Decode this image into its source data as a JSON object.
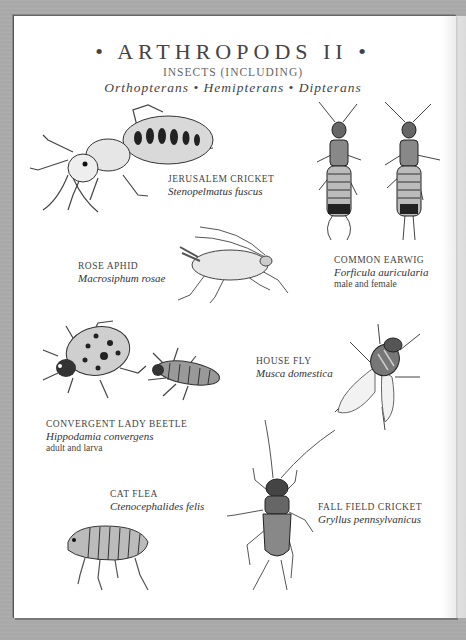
{
  "plate": {
    "title": "• ARTHROPODS II •",
    "subtitle": "INSECTS (INCLUDING)",
    "orders": "Orthopterans • Hemipterans • Dipterans",
    "colors": {
      "background": "#a9a9a9",
      "paper": "#ffffff",
      "ink": "#333333"
    }
  },
  "specimens": [
    {
      "common": "JERUSALEM CRICKET",
      "scientific": "Stenopelmatus fuscus",
      "note": ""
    },
    {
      "common": "COMMON EARWIG",
      "scientific": "Forficula auricularia",
      "note": "male and female"
    },
    {
      "common": "ROSE APHID",
      "scientific": "Macrosiphum rosae",
      "note": ""
    },
    {
      "common": "HOUSE FLY",
      "scientific": "Musca domestica",
      "note": ""
    },
    {
      "common": "CONVERGENT LADY BEETLE",
      "scientific": "Hippodamia convergens",
      "note": "adult and larva"
    },
    {
      "common": "CAT FLEA",
      "scientific": "Ctenocephalides felis",
      "note": ""
    },
    {
      "common": "FALL FIELD CRICKET",
      "scientific": "Gryllus pennsylvanicus",
      "note": ""
    }
  ]
}
